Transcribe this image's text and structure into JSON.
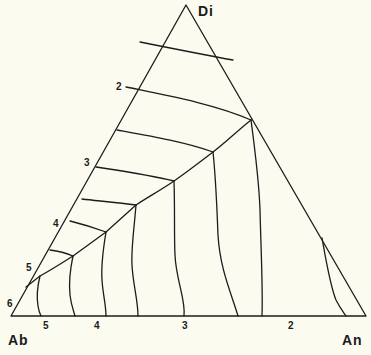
{
  "diagram": {
    "type": "ternary-phase-diagram",
    "vertices": {
      "top": "Di",
      "bottom_left": "Ab",
      "bottom_right": "An"
    },
    "left_edge_labels": [
      "2",
      "3",
      "4",
      "5",
      "6"
    ],
    "bottom_edge_labels": [
      "5",
      "4",
      "3",
      "2"
    ],
    "line_color": "#1c1c1c",
    "background_color": "#fbfbf0"
  }
}
